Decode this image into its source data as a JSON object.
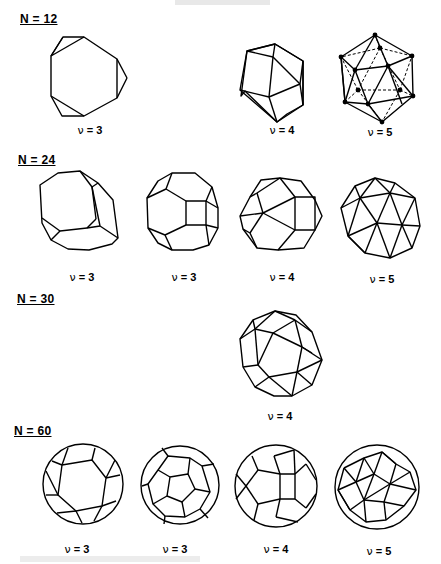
{
  "groups": [
    {
      "label": "N = 12",
      "items": [
        {
          "nu_symbol": "ν",
          "nu_value": "= 3"
        },
        {
          "nu_symbol": "ν",
          "nu_value": "= 4"
        },
        {
          "nu_symbol": "ν",
          "nu_value": "= 5"
        }
      ]
    },
    {
      "label": "N = 24",
      "items": [
        {
          "nu_symbol": "ν",
          "nu_value": "= 3"
        },
        {
          "nu_symbol": "ν",
          "nu_value": "= 3"
        },
        {
          "nu_symbol": "ν",
          "nu_value": "= 4"
        },
        {
          "nu_symbol": "ν",
          "nu_value": "= 5"
        }
      ]
    },
    {
      "label": "N = 30",
      "items": [
        {
          "nu_symbol": "ν",
          "nu_value": "= 4"
        }
      ]
    },
    {
      "label": "N = 60",
      "items": [
        {
          "nu_symbol": "ν",
          "nu_value": "= 3"
        },
        {
          "nu_symbol": "ν",
          "nu_value": "= 3"
        },
        {
          "nu_symbol": "ν",
          "nu_value": "= 4"
        },
        {
          "nu_symbol": "ν",
          "nu_value": "= 5"
        }
      ]
    }
  ]
}
